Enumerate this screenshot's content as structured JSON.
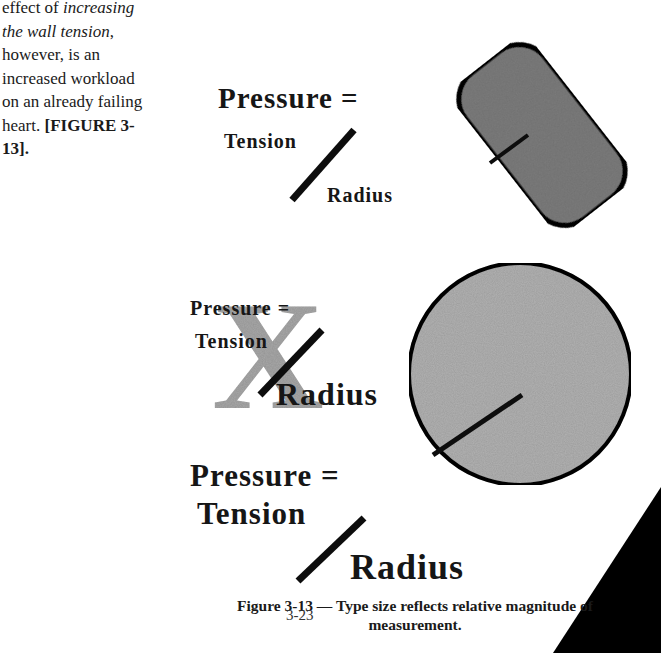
{
  "body_text": {
    "line1_plain": "effect of ",
    "line1_italic": "increasing",
    "line2_italic": "the wall tension",
    "line2_plain": ",",
    "line3": "however, is an",
    "line4": "increased workload",
    "line5": "on an already failing",
    "line6_plain": "heart. ",
    "line6_bold": "[FIGURE 3-",
    "line7_bold": "13]."
  },
  "equation_top": {
    "pressure": "Pressure =",
    "tension": "Tension",
    "radius": "Radius",
    "shape": "elongated-rounded-rectangle"
  },
  "equation_crossed": {
    "pressure": "Pressure =",
    "tension": "Tension",
    "radius": "Radius",
    "crossed_mark": "X",
    "shape": "circle-small-label"
  },
  "equation_large": {
    "pressure": "Pressure =",
    "tension": "Tension",
    "radius": "Radius",
    "shape": "circle"
  },
  "caption": {
    "line1": "Figure 3-13 — Type size reflects relative magnitude of",
    "line2": "measurement."
  },
  "page_number": "3-23",
  "colors": {
    "shape_fill_dark": "#7d7d7d",
    "shape_fill_light": "#b4b4b4",
    "x_mark": "#a9a9a9",
    "ink": "#111111"
  }
}
